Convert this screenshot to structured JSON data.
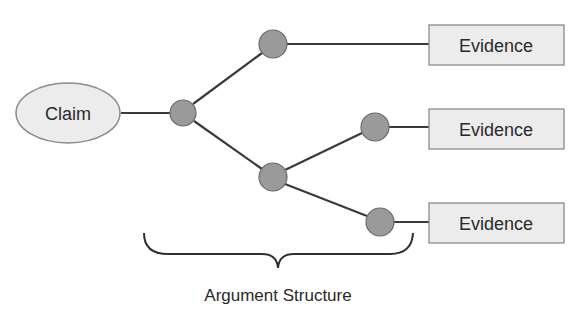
{
  "diagram": {
    "claim": {
      "label": "Claim",
      "cx": 68,
      "cy": 113,
      "rx": 52,
      "ry": 30
    },
    "evidence": [
      {
        "label": "Evidence",
        "x": 429,
        "y": 25,
        "w": 135,
        "h": 40
      },
      {
        "label": "Evidence",
        "x": 429,
        "y": 109,
        "w": 135,
        "h": 40
      },
      {
        "label": "Evidence",
        "x": 429,
        "y": 203,
        "w": 135,
        "h": 40
      }
    ],
    "nodes": [
      {
        "id": "A",
        "cx": 183,
        "cy": 113
      },
      {
        "id": "B",
        "cx": 273,
        "cy": 44
      },
      {
        "id": "C",
        "cx": 273,
        "cy": 177
      },
      {
        "id": "D",
        "cx": 375,
        "cy": 127
      },
      {
        "id": "E",
        "cx": 380,
        "cy": 222
      }
    ],
    "brace_label": "Argument Structure"
  },
  "colors": {
    "node_fill": "#9a9a9a",
    "node_stroke": "#6a6a6a",
    "box_fill": "#ececec",
    "box_stroke": "#8a8a8a",
    "line": "#3a3a3a"
  }
}
